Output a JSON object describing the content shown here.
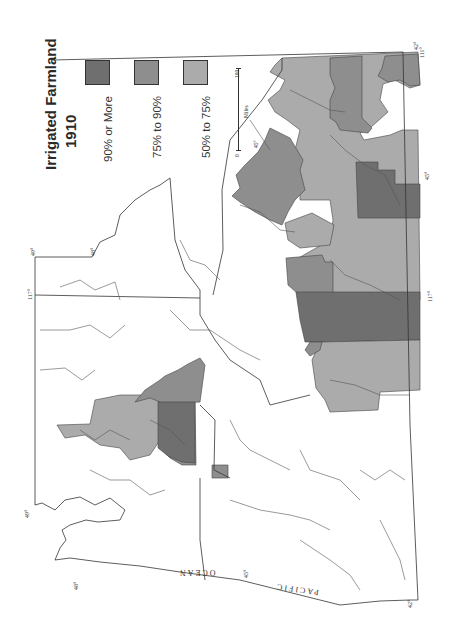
{
  "legend": {
    "title_line1": "Irrigated   Farmland",
    "title_line2": "1910",
    "items": [
      {
        "label": "90% or More",
        "color": "#6f6f6f"
      },
      {
        "label": "75% to 90%",
        "color": "#8e8e8e"
      },
      {
        "label": "50% to 75%",
        "color": "#ababab"
      }
    ]
  },
  "scale": {
    "start": "0",
    "end": "100",
    "unit": "Miles",
    "marker": "45°"
  },
  "labels": {
    "ocean1": "OCEAN",
    "ocean2": "PACIFIC"
  },
  "degree_labels": [
    "49°",
    "48°",
    "117°",
    "49°",
    "48°",
    "45°",
    "42°",
    "42°",
    "111°",
    "45°",
    "117°"
  ],
  "colors": {
    "dark": "#6f6f6f",
    "medium": "#8e8e8e",
    "light": "#ababab",
    "line": "#3a3a3a"
  }
}
